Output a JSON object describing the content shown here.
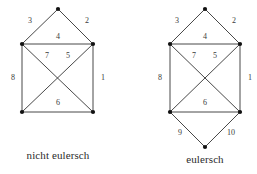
{
  "figure": {
    "background_color": "#ffffff",
    "edge_color": "#333333",
    "vertex_color": "#111111",
    "label_color": "#3a3a3a",
    "caption_color": "#2b2b2b"
  },
  "graphs": [
    {
      "id": "left-graph",
      "caption": "nicht eulersch",
      "caption_pos": {
        "x": 58,
        "y": 156
      },
      "vertices": [
        {
          "id": "top-apex",
          "x": 58,
          "y": 9
        },
        {
          "id": "upper-left",
          "x": 22,
          "y": 44
        },
        {
          "id": "upper-right",
          "x": 93,
          "y": 44
        },
        {
          "id": "lower-left",
          "x": 22,
          "y": 112
        },
        {
          "id": "lower-right",
          "x": 93,
          "y": 112
        }
      ],
      "edges": [
        {
          "label": "1",
          "from": "upper-right",
          "to": "lower-right",
          "lx": 103,
          "ly": 78
        },
        {
          "label": "2",
          "from": "top-apex",
          "to": "upper-right",
          "lx": 87,
          "ly": 21
        },
        {
          "label": "3",
          "from": "top-apex",
          "to": "upper-left",
          "lx": 30,
          "ly": 21
        },
        {
          "label": "4",
          "from": "upper-left",
          "to": "upper-right",
          "lx": 58,
          "ly": 37
        },
        {
          "label": "5",
          "from": "upper-right",
          "to": "lower-left",
          "lx": 68,
          "ly": 56
        },
        {
          "label": "6",
          "from": "lower-left",
          "to": "lower-right",
          "lx": 58,
          "ly": 103
        },
        {
          "label": "7",
          "from": "upper-left",
          "to": "lower-right",
          "lx": 47,
          "ly": 56
        },
        {
          "label": "8",
          "from": "upper-left",
          "to": "lower-left",
          "lx": 13,
          "ly": 78
        }
      ]
    },
    {
      "id": "right-graph",
      "caption": "eulersch",
      "caption_pos": {
        "x": 205,
        "y": 160
      },
      "vertices": [
        {
          "id": "top-apex",
          "x": 205,
          "y": 9
        },
        {
          "id": "upper-left",
          "x": 170,
          "y": 44
        },
        {
          "id": "upper-right",
          "x": 240,
          "y": 44
        },
        {
          "id": "lower-left",
          "x": 170,
          "y": 112
        },
        {
          "id": "lower-right",
          "x": 240,
          "y": 112
        },
        {
          "id": "bottom-apex",
          "x": 205,
          "y": 147
        }
      ],
      "edges": [
        {
          "label": "1",
          "from": "upper-right",
          "to": "lower-right",
          "lx": 250,
          "ly": 78
        },
        {
          "label": "2",
          "from": "top-apex",
          "to": "upper-right",
          "lx": 234,
          "ly": 21
        },
        {
          "label": "3",
          "from": "top-apex",
          "to": "upper-left",
          "lx": 177,
          "ly": 21
        },
        {
          "label": "4",
          "from": "upper-left",
          "to": "upper-right",
          "lx": 205,
          "ly": 37
        },
        {
          "label": "5",
          "from": "upper-right",
          "to": "lower-left",
          "lx": 215,
          "ly": 56
        },
        {
          "label": "6",
          "from": "lower-left",
          "to": "lower-right",
          "lx": 205,
          "ly": 103
        },
        {
          "label": "7",
          "from": "upper-left",
          "to": "lower-right",
          "lx": 194,
          "ly": 56
        },
        {
          "label": "8",
          "from": "upper-left",
          "to": "lower-left",
          "lx": 160,
          "ly": 78
        },
        {
          "label": "9",
          "from": "lower-left",
          "to": "bottom-apex",
          "lx": 180,
          "ly": 133
        },
        {
          "label": "10",
          "from": "lower-right",
          "to": "bottom-apex",
          "lx": 231,
          "ly": 133
        }
      ]
    }
  ]
}
